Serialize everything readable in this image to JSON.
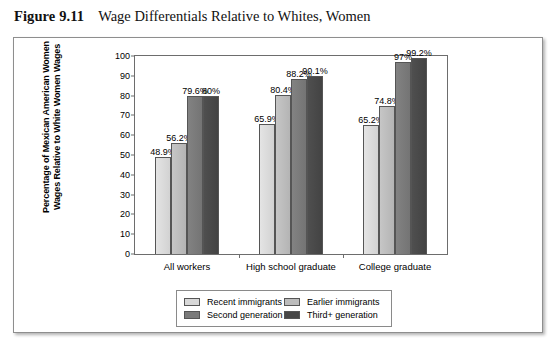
{
  "caption": {
    "number": "Figure 9.11",
    "title": "Wage Differentials Relative to Whites, Women"
  },
  "chart_data": {
    "type": "bar",
    "title": "Wage Differentials Relative to Whites, Women",
    "xlabel": "",
    "ylabel": "Percentage of Mexican American Women Wages Relative to White Women Wages",
    "ylabel_line1": "Percentage of Mexican American Women",
    "ylabel_line2": "Wages Relative to White Women Wages",
    "ylim": [
      0,
      100
    ],
    "yticks": [
      0,
      10,
      20,
      30,
      40,
      50,
      60,
      70,
      80,
      90,
      100
    ],
    "ytick_labels": [
      "0",
      "10",
      "20",
      "30",
      "40",
      "50",
      "60",
      "70",
      "80",
      "90",
      "100"
    ],
    "grid": false,
    "legend_position": "bottom",
    "categories": [
      "All workers",
      "High school graduate",
      "College graduate"
    ],
    "series": [
      {
        "name": "Recent immigrants",
        "color": "#d8d8d8",
        "values": [
          48.9,
          65.9,
          65.2
        ],
        "labels": [
          "48.9%",
          "65.9%",
          "65.2%"
        ]
      },
      {
        "name": "Earlier immigrants",
        "color": "#bcbcbc",
        "values": [
          56.2,
          80.4,
          74.8
        ],
        "labels": [
          "56.2%",
          "80.4%",
          "74.8%"
        ]
      },
      {
        "name": "Second generation",
        "color": "#7a7a7a",
        "values": [
          79.6,
          88.2,
          97.0
        ],
        "labels": [
          "79.6%",
          "88.2%",
          "97%"
        ]
      },
      {
        "name": "Third+ generation",
        "color": "#474747",
        "values": [
          80.0,
          90.1,
          99.2
        ],
        "labels": [
          "80%",
          "90.1%",
          "99.2%"
        ]
      }
    ]
  }
}
